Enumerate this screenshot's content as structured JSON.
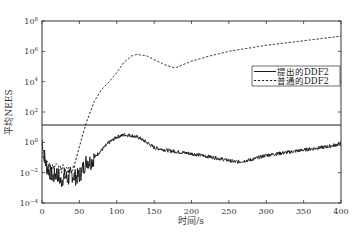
{
  "chart_data": {
    "type": "line",
    "title": "",
    "xlabel": "时间/s",
    "ylabel": "平均NEES",
    "xlim": [
      0,
      400
    ],
    "ylim_log10": [
      -4,
      8
    ],
    "yscale": "log",
    "x_ticks": [
      0,
      50,
      100,
      150,
      200,
      250,
      300,
      350,
      400
    ],
    "y_ticks_log10": [
      -4,
      -2,
      0,
      2,
      4,
      6,
      8
    ],
    "y_tick_labels": [
      "10^-4",
      "10^-2",
      "10^0",
      "10^2",
      "10^4",
      "10^6",
      "10^8"
    ],
    "grid": false,
    "legend_position": "upper right (inside, mid-height)",
    "threshold_line": {
      "label": "",
      "log10_value": 1.14,
      "value": 13.8,
      "style": "solid"
    },
    "series": [
      {
        "name": "提出的DDF2",
        "style": "solid",
        "x": [
          0,
          3,
          6,
          10,
          15,
          20,
          25,
          30,
          35,
          40,
          45,
          50,
          55,
          60,
          65,
          70,
          80,
          90,
          100,
          110,
          120,
          130,
          140,
          150,
          170,
          200,
          230,
          260,
          280,
          300,
          330,
          350,
          380,
          400
        ],
        "log10_values": [
          0.2,
          -0.8,
          -1.6,
          -1.9,
          -2.3,
          -2.0,
          -2.6,
          -2.2,
          -2.4,
          -2.1,
          -2.3,
          -2.2,
          -1.7,
          -1.2,
          -1.3,
          -1.0,
          -0.5,
          0.0,
          0.35,
          0.5,
          0.45,
          0.3,
          0.0,
          -0.35,
          -0.55,
          -0.75,
          -1.0,
          -1.3,
          -1.15,
          -0.85,
          -0.65,
          -0.5,
          -0.3,
          -0.1
        ]
      },
      {
        "name": "普通的DDF2",
        "style": "dashed",
        "x": [
          0,
          5,
          10,
          15,
          20,
          25,
          30,
          35,
          40,
          45,
          50,
          55,
          60,
          70,
          80,
          90,
          100,
          110,
          120,
          127,
          140,
          150,
          165,
          178,
          190,
          200,
          225,
          250,
          275,
          300,
          325,
          350,
          375,
          400
        ],
        "log10_values": [
          -0.8,
          -1.4,
          -1.5,
          -1.7,
          -1.6,
          -1.8,
          -1.6,
          -1.9,
          -1.8,
          -1.2,
          -0.3,
          0.6,
          1.4,
          2.7,
          3.5,
          4.0,
          4.6,
          5.3,
          5.7,
          5.8,
          5.7,
          5.45,
          5.1,
          4.9,
          5.15,
          5.35,
          5.7,
          6.0,
          6.2,
          6.4,
          6.55,
          6.7,
          6.85,
          7.0
        ]
      }
    ]
  },
  "axes": {
    "xlabel": "时间/s",
    "ylabel": "平均NEES",
    "x_tick_labels": [
      "0",
      "50",
      "100",
      "150",
      "200",
      "250",
      "300",
      "350",
      "400"
    ],
    "y_tick_bases": [
      "10",
      "10",
      "10",
      "10",
      "10",
      "10",
      "10"
    ],
    "y_tick_exponents": [
      "8",
      "6",
      "4",
      "2",
      "0",
      "−2",
      "−4"
    ]
  },
  "legend": {
    "items": [
      {
        "label": "提出的DDF2",
        "style": "solid"
      },
      {
        "label": "普通的DDF2",
        "style": "dashed"
      }
    ]
  },
  "colors": {
    "line": "#1a1a1a",
    "frame": "#333333",
    "background": "#ffffff"
  }
}
